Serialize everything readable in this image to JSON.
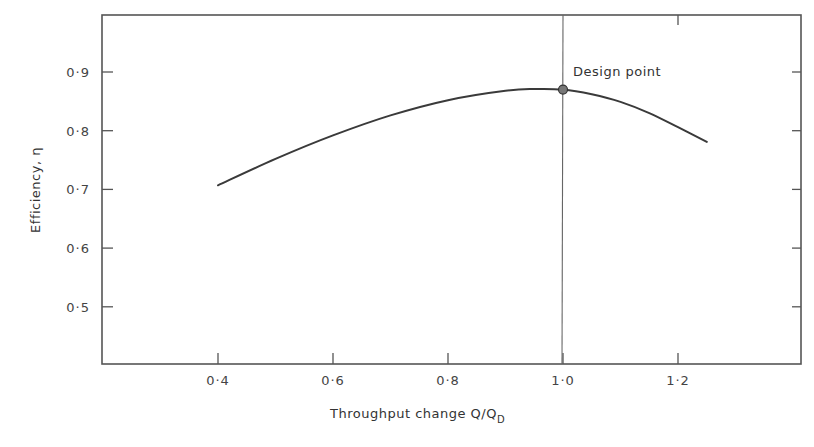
{
  "chart_data": {
    "type": "line",
    "title": "",
    "xlabel": "Throughput change Q/Q_D",
    "ylabel": "Efficiency, η",
    "xlim": [
      0.2,
      1.4
    ],
    "ylim": [
      0.4,
      1.0
    ],
    "grid": false,
    "legend": null,
    "x_ticks": [
      "0·4",
      "0·6",
      "0·8",
      "1·0",
      "1·2"
    ],
    "x_tick_values": [
      0.4,
      0.6,
      0.8,
      1.0,
      1.2
    ],
    "y_ticks": [
      "0·5",
      "0·6",
      "0·7",
      "0·8",
      "0·9"
    ],
    "y_tick_values": [
      0.5,
      0.6,
      0.7,
      0.8,
      0.9
    ],
    "series": [
      {
        "name": "Efficiency curve",
        "x": [
          0.4,
          0.5,
          0.6,
          0.7,
          0.8,
          0.9,
          0.95,
          1.0,
          1.05,
          1.1,
          1.15,
          1.2,
          1.25
        ],
        "y": [
          0.707,
          0.752,
          0.792,
          0.826,
          0.852,
          0.868,
          0.871,
          0.87,
          0.862,
          0.849,
          0.83,
          0.806,
          0.781
        ]
      }
    ],
    "annotations": [
      {
        "text": "Design point",
        "x": 1.0,
        "y": 0.87,
        "marker": "circle",
        "vertical_line_at_x": 1.0
      }
    ]
  },
  "labels": {
    "x_axis_title": "Throughput change  Q/Q",
    "x_axis_subscript": "D",
    "y_axis_title": "Efficiency,  η",
    "design_point": "Design point"
  }
}
